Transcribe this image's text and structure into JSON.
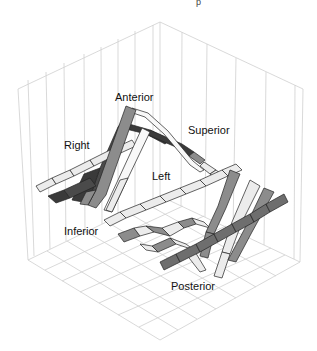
{
  "figure": {
    "top_text_fragment": "p",
    "labels": {
      "anterior": "Anterior",
      "superior": "Superior",
      "right": "Right",
      "left": "Left",
      "inferior": "Inferior",
      "posterior": "Posterior"
    },
    "colors": {
      "grid": "#cfcfcf",
      "outline": "#222222",
      "light": "#ececec",
      "mid": "#8c8c8c",
      "dark": "#4a4a4a",
      "darker": "#3a3a3a",
      "white": "#f8f8f8"
    },
    "ribbons": [
      {
        "name": "anterior-peak-mid",
        "shade": "mid"
      },
      {
        "name": "anterior-peak-light",
        "shade": "light"
      },
      {
        "name": "right-dark",
        "shade": "dark"
      },
      {
        "name": "superior-dark",
        "shade": "darker"
      },
      {
        "name": "left-light",
        "shade": "light"
      },
      {
        "name": "inferior-mid",
        "shade": "mid"
      },
      {
        "name": "posterior-mid-1",
        "shade": "mid"
      },
      {
        "name": "posterior-light",
        "shade": "light"
      },
      {
        "name": "posterior-mid-2",
        "shade": "mid"
      },
      {
        "name": "posterior-dark-band",
        "shade": "dark"
      }
    ]
  }
}
